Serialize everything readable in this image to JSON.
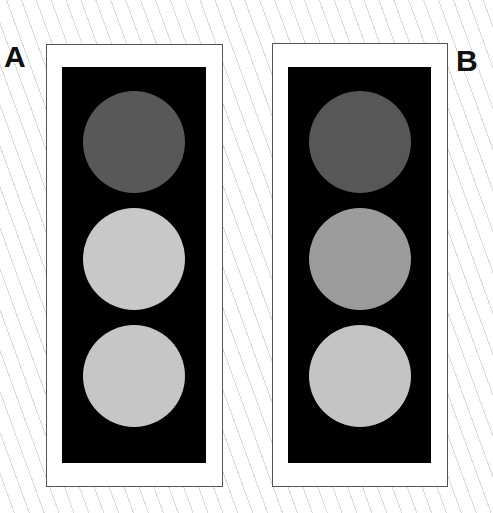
{
  "panels": [
    {
      "label": "A",
      "lamps": [
        {
          "position": "top",
          "color": "#585858"
        },
        {
          "position": "middle",
          "color": "#c8c8c8"
        },
        {
          "position": "bottom",
          "color": "#c6c6c6"
        }
      ]
    },
    {
      "label": "B",
      "lamps": [
        {
          "position": "top",
          "color": "#575757"
        },
        {
          "position": "middle",
          "color": "#9c9c9c"
        },
        {
          "position": "bottom",
          "color": "#c4c4c4"
        }
      ]
    }
  ]
}
